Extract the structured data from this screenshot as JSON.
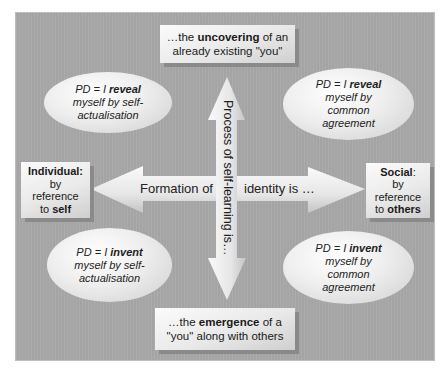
{
  "diagram": {
    "top_box": {
      "prefix": "…the ",
      "bold": "uncovering",
      "suffix": " of an",
      "line2": "already existing \"you\""
    },
    "bottom_box": {
      "prefix": "…the ",
      "bold": "emergence",
      "suffix": " of a",
      "line2": "\"you\" along with others"
    },
    "left_box": {
      "title": "Individual:",
      "line2": "by",
      "line3": "reference",
      "line4_prefix": "to ",
      "line4_bold": "self"
    },
    "right_box": {
      "title": "Social",
      "title_suffix": ":",
      "line2": "by",
      "line3": "reference",
      "line4_prefix": "to ",
      "line4_bold": "others"
    },
    "ellipses": [
      {
        "position": "top-left",
        "prefix": "PD = I ",
        "bold": "reveal",
        "lines": [
          "myself by self-",
          "actualisation"
        ]
      },
      {
        "position": "top-right",
        "prefix": "PD = I ",
        "bold": "reveal",
        "lines": [
          "myself by",
          "common",
          "agreement"
        ]
      },
      {
        "position": "bottom-left",
        "prefix": "PD = I ",
        "bold": "invent",
        "lines": [
          "myself by self-",
          "actualisation"
        ]
      },
      {
        "position": "bottom-right",
        "prefix": "PD = I ",
        "bold": "invent",
        "lines": [
          "myself by",
          "common",
          "agreement"
        ]
      }
    ],
    "horizontal_arrow": {
      "left_label": "Formation of",
      "right_label": "identity is …"
    },
    "vertical_arrow": {
      "label": "Process of self-learning is…"
    },
    "colors": {
      "panel": "#a9a9a9",
      "shape_light": "#f5f5f5",
      "shape_dark": "#c8c8c8",
      "shadow": "#8a8a8a",
      "text": "#1a1a1a"
    }
  }
}
